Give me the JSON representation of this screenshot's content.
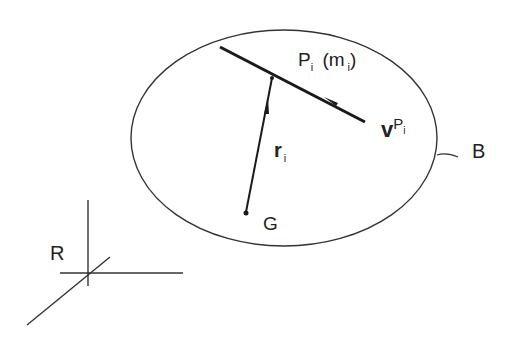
{
  "diagram": {
    "labels": {
      "particle": {
        "main": "P",
        "sub": "i",
        "mass_open": "(m",
        "mass_sub": "i",
        "mass_close": ")"
      },
      "velocity": {
        "main": "v",
        "sup_main": "P",
        "sup_sub": "i"
      },
      "position": {
        "main": "r",
        "sub": "i"
      },
      "center_of_mass": "G",
      "body": "B",
      "reference_frame": "R"
    },
    "colors": {
      "stroke": "#222222",
      "background": "#ffffff"
    },
    "ellipse": {
      "cx": 284,
      "cy": 138,
      "rx": 153,
      "ry": 108
    }
  }
}
